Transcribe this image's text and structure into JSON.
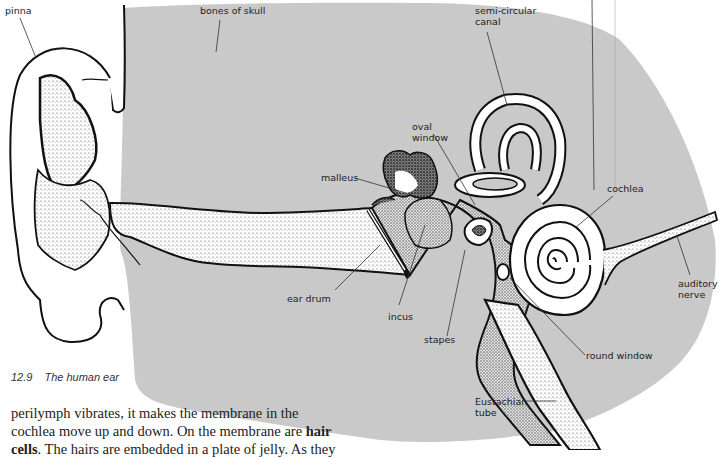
{
  "figure": {
    "number": "12.9",
    "title": "The human ear",
    "colors": {
      "skull_fill": "#c9c9c9",
      "outline": "#111111",
      "canal_fill": "#ffffff",
      "stipple": "#555555"
    },
    "labels": {
      "pinna": "pinna",
      "bones_of_skull": "bones of skull",
      "semi_circular_canal": "semi-circular\ncanal",
      "oval_window": "oval\nwindow",
      "malleus": "malleus",
      "cochlea": "cochlea",
      "ear_drum": "ear drum",
      "incus": "incus",
      "stapes": "stapes",
      "auditory_nerve": "auditory\nnerve",
      "round_window": "round window",
      "eustachian_tube": "Eustachian\ntube"
    }
  },
  "body_text": {
    "line1": "perilymph vibrates, it makes the membrane in the",
    "line2_pre": "cochlea move up and down. On the membrane are ",
    "line2_bold": "hair",
    "line3_bold": "cells",
    "line3_post": ". The hairs are embedded in a plate of jelly. As they"
  }
}
